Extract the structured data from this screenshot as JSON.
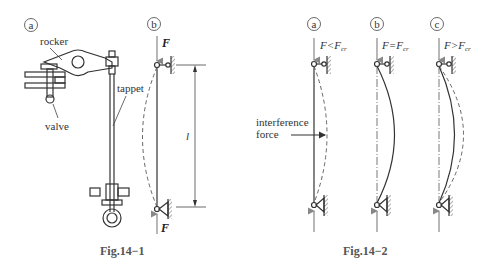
{
  "fig1": {
    "caption": "Fig.14−1",
    "panel_a": "a",
    "panel_b": "b",
    "labels": {
      "rocker": "rocker",
      "tappet": "tappet",
      "valve": "valve"
    },
    "force_top": "F",
    "force_bottom": "F",
    "length_label": "l"
  },
  "fig2": {
    "caption": "Fig.14−2",
    "panels": [
      {
        "id": "a",
        "condition_lhs": "F",
        "condition_op": "<",
        "condition_rhs": "F",
        "condition_sub": "cr"
      },
      {
        "id": "b",
        "condition_lhs": "F",
        "condition_op": "=",
        "condition_rhs": "F",
        "condition_sub": "cr"
      },
      {
        "id": "c",
        "condition_lhs": "F",
        "condition_op": ">",
        "condition_rhs": "F",
        "condition_sub": "cr"
      }
    ],
    "interference_label_line1": "interference",
    "interference_label_line2": "force"
  }
}
